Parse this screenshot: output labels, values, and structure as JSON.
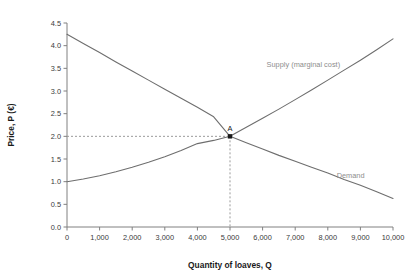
{
  "chart_data": {
    "type": "line",
    "title": "",
    "xlabel": "Quantity of loaves, Q",
    "ylabel": "Price, P (€)",
    "xlim": [
      0,
      10000
    ],
    "ylim": [
      0.0,
      4.5
    ],
    "grid": false,
    "legend_position": "inline-curve-labels",
    "x_ticks": [
      0,
      1000,
      2000,
      3000,
      4000,
      5000,
      6000,
      7000,
      8000,
      9000,
      10000
    ],
    "x_tick_labels": [
      "0",
      "1,000",
      "2,000",
      "3,000",
      "4,000",
      "5,000",
      "6,000",
      "7,000",
      "8,000",
      "9,000",
      "10,000"
    ],
    "y_ticks": [
      0.0,
      0.5,
      1.0,
      1.5,
      2.0,
      2.5,
      3.0,
      3.5,
      4.0,
      4.5
    ],
    "y_tick_labels": [
      "0.0",
      "0.5",
      "1.0",
      "1.5",
      "2.0",
      "2.5",
      "3.0",
      "3.5",
      "4.0",
      "4.5"
    ],
    "series": [
      {
        "name": "Demand",
        "label": "Demand",
        "label_x": 8700,
        "label_y": 1.08,
        "color": "#6e6e6e",
        "x": [
          0,
          500,
          1000,
          1500,
          2000,
          2500,
          3000,
          3500,
          4000,
          4500,
          5000,
          5500,
          6000,
          6500,
          7000,
          7500,
          8000,
          8500,
          9000,
          9500,
          10000
        ],
        "values": [
          4.25,
          4.05,
          3.85,
          3.64,
          3.44,
          3.24,
          3.04,
          2.84,
          2.64,
          2.43,
          2.0,
          1.86,
          1.72,
          1.58,
          1.45,
          1.32,
          1.19,
          1.05,
          0.92,
          0.78,
          0.63
        ]
      },
      {
        "name": "Supply (marginal cost)",
        "label": "Supply (marginal cost)",
        "label_x": 7250,
        "label_y": 3.52,
        "color": "#6e6e6e",
        "x": [
          0,
          500,
          1000,
          1500,
          2000,
          2500,
          3000,
          3500,
          4000,
          4500,
          5000,
          5500,
          6000,
          6500,
          7000,
          7500,
          8000,
          8500,
          9000,
          9500,
          10000
        ],
        "values": [
          1.0,
          1.06,
          1.13,
          1.22,
          1.32,
          1.43,
          1.55,
          1.69,
          1.84,
          1.91,
          2.0,
          2.2,
          2.4,
          2.6,
          2.81,
          3.02,
          3.24,
          3.46,
          3.68,
          3.91,
          4.15
        ]
      }
    ],
    "annotations": [
      {
        "name": "equilibrium-point",
        "label": "A",
        "x": 5000,
        "y": 2.0,
        "marker": "square",
        "guides": [
          "horizontal-to-y-axis",
          "vertical-to-x-axis"
        ]
      }
    ]
  }
}
